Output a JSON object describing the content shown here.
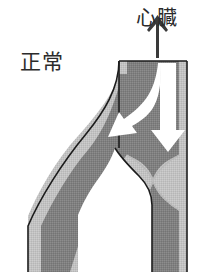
{
  "figure": {
    "name": "venous-valve-normal-diagram",
    "caption_labels": {
      "normal": "正常",
      "heart": "心臓"
    },
    "icons": {
      "up_arrow": "up-arrow-icon",
      "down_flow_arrow": "down-flow-arrow-icon",
      "branch_flow_arrow": "branch-flow-arrow-icon"
    },
    "colors": {
      "background": "#ffffff",
      "vessel_wall": "#c2c2c2",
      "vessel_lumen": "#808080",
      "outline": "#1a1a1a",
      "flow_arrow": "#ffffff",
      "text": "#2b2b2b"
    },
    "anatomy": {
      "main_vein_label": "vertical-main-vein",
      "branch_vein_label": "diagonal-branch-vein",
      "valve_label": "venous-valve"
    }
  }
}
